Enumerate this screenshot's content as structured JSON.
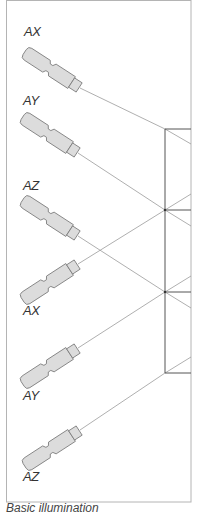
{
  "diagram": {
    "caption": "Basic illumination",
    "colors": {
      "frame": "#b4b4b4",
      "screen": "#555555",
      "beam": "#9a9a9a",
      "lamp_fill": "#dcdcdc",
      "lamp_stroke": "#7a7a7a",
      "label": "#333333"
    },
    "lamps": [
      {
        "label": "AX",
        "group": "upper",
        "direction": "down-right"
      },
      {
        "label": "AY",
        "group": "upper",
        "direction": "down-right"
      },
      {
        "label": "AZ",
        "group": "upper",
        "direction": "down-right"
      },
      {
        "label": "AX",
        "group": "lower",
        "direction": "up-right"
      },
      {
        "label": "AY",
        "group": "lower",
        "direction": "up-right"
      },
      {
        "label": "AZ",
        "group": "lower",
        "direction": "up-right"
      }
    ]
  }
}
